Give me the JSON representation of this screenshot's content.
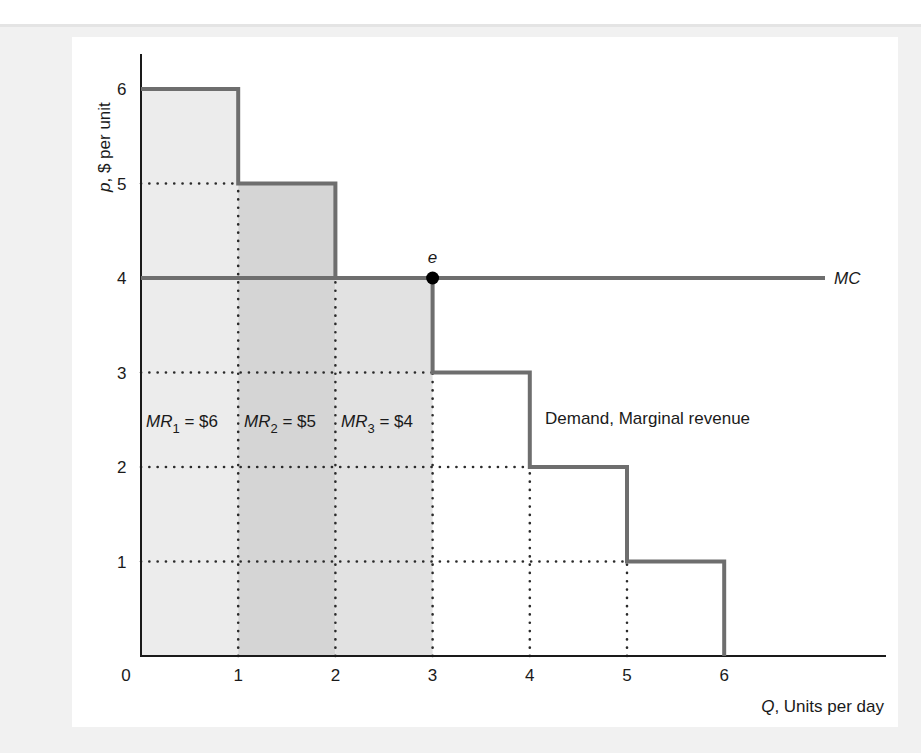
{
  "chart_data": {
    "type": "bar",
    "subtype": "step-demand-with-marginal-cost",
    "title": "",
    "xlabel": {
      "var": "Q",
      "rest": ", Units per day"
    },
    "ylabel": {
      "var": "p",
      "rest": ", $ per unit"
    },
    "xlim": [
      0,
      7.5
    ],
    "ylim": [
      0,
      6.5
    ],
    "x_ticks": [
      "0",
      "1",
      "2",
      "3",
      "4",
      "5",
      "6"
    ],
    "y_ticks": [
      "1",
      "2",
      "3",
      "4",
      "5",
      "6"
    ],
    "grid": false,
    "series": [
      {
        "name": "Demand, Marginal revenue",
        "type": "step",
        "steps": [
          {
            "q_from": 0,
            "q_to": 1,
            "p": 6
          },
          {
            "q_from": 1,
            "q_to": 2,
            "p": 5
          },
          {
            "q_from": 2,
            "q_to": 3,
            "p": 4
          },
          {
            "q_from": 3,
            "q_to": 4,
            "p": 3
          },
          {
            "q_from": 4,
            "q_to": 5,
            "p": 2
          },
          {
            "q_from": 5,
            "q_to": 6,
            "p": 1
          }
        ]
      },
      {
        "name": "MC",
        "type": "line",
        "value": 4,
        "x_range": [
          0,
          7.2
        ]
      }
    ],
    "shaded_areas": [
      {
        "q_from": 0,
        "q_to": 1,
        "height": 6,
        "label_sym": "MR",
        "label_sub": "1",
        "label_rest": " = $6",
        "color": "#ececec"
      },
      {
        "q_from": 1,
        "q_to": 2,
        "height": 5,
        "label_sym": "MR",
        "label_sub": "2",
        "label_rest": " = $5",
        "color": "#d5d5d5"
      },
      {
        "q_from": 2,
        "q_to": 3,
        "height": 4,
        "label_sym": "MR",
        "label_sub": "3",
        "label_rest": " = $4",
        "color": "#e2e2e2"
      }
    ],
    "annotations": [
      {
        "text": "e",
        "x": 3,
        "y": 4,
        "marker": "filled-circle"
      },
      {
        "text": "MC",
        "x": 7.3,
        "y": 4
      },
      {
        "text": "Demand, Marginal revenue",
        "x": 4.15,
        "y": 2.5
      }
    ],
    "dotted_guides": [
      {
        "orientation": "h",
        "y": 5,
        "x_from": 0,
        "x_to": 1
      },
      {
        "orientation": "h",
        "y": 3,
        "x_from": 0,
        "x_to": 3
      },
      {
        "orientation": "h",
        "y": 2,
        "x_from": 0,
        "x_to": 4
      },
      {
        "orientation": "h",
        "y": 1,
        "x_from": 0,
        "x_to": 5
      },
      {
        "orientation": "v",
        "x": 1,
        "y_from": 0,
        "y_to": 5
      },
      {
        "orientation": "v",
        "x": 2,
        "y_from": 0,
        "y_to": 4
      },
      {
        "orientation": "v",
        "x": 3,
        "y_from": 0,
        "y_to": 3
      },
      {
        "orientation": "v",
        "x": 4,
        "y_from": 0,
        "y_to": 2
      },
      {
        "orientation": "v",
        "x": 5,
        "y_from": 0,
        "y_to": 1
      }
    ],
    "colors": {
      "curve": "#6e6e6e",
      "axis": "#1a1a1a",
      "dots": "#2a2a2a",
      "marker": "#000000"
    }
  }
}
